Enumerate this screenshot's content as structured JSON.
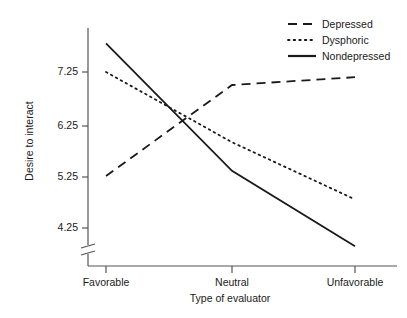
{
  "chart_data": {
    "type": "line",
    "title": "",
    "xlabel": "Type of evaluator",
    "ylabel": "Desire to interact",
    "categories": [
      "Favorable",
      "Neutral",
      "Unfavorable"
    ],
    "ytick_labels": [
      "7.25",
      "6.25",
      "5.25",
      "4.25"
    ],
    "ytick_values": [
      7.25,
      6.25,
      5.25,
      4.25
    ],
    "ylim": [
      3.7,
      8.0
    ],
    "axis_break": true,
    "grid": false,
    "legend_position": "top-right",
    "series": [
      {
        "name": "Depressed",
        "style": "dashed",
        "values": [
          5.25,
          7.0,
          7.15
        ]
      },
      {
        "name": "Dysphoric",
        "style": "dotted",
        "values": [
          7.25,
          5.9,
          4.8
        ]
      },
      {
        "name": "Nondepressed",
        "style": "solid",
        "values": [
          7.8,
          5.35,
          3.9
        ]
      }
    ]
  },
  "axes": {
    "ylabel": "Desire to interact",
    "xlabel": "Type of evaluator",
    "yticks": [
      "7.25",
      "6.25",
      "5.25",
      "4.25"
    ],
    "xticks": [
      "Favorable",
      "Neutral",
      "Unfavorable"
    ]
  },
  "legend": {
    "items": [
      {
        "label": "Depressed",
        "style": "dashed"
      },
      {
        "label": "Dysphoric",
        "style": "dotted"
      },
      {
        "label": "Nondepressed",
        "style": "solid"
      }
    ]
  },
  "colors": {
    "ink": "#1a1a1a",
    "axis": "#555555",
    "background": "#ffffff"
  }
}
